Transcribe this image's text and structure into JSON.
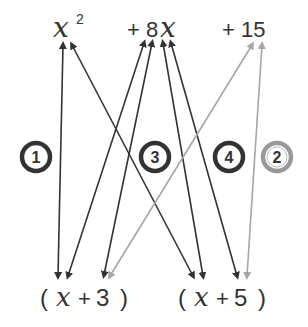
{
  "top_terms": {
    "x_var": "x",
    "x_exp": "2",
    "plus_8": "+ 8",
    "x_var2": "x",
    "plus_15": "+ 15"
  },
  "bottom_factors": {
    "f1_open": "(",
    "f1_x": "x",
    "f1_plus": "+",
    "f1_num": "3",
    "f1_close": ")",
    "f2_open": "(",
    "f2_x": "x",
    "f2_plus": "+",
    "f2_num": "5",
    "f2_close": ")"
  },
  "steps": [
    {
      "label": "1",
      "color": "#333333"
    },
    {
      "label": "3",
      "color": "#333333"
    },
    {
      "label": "4",
      "color": "#333333"
    },
    {
      "label": "2",
      "color": "#999999"
    }
  ],
  "colors": {
    "dark": "#333333",
    "light": "#a6a6a6"
  }
}
